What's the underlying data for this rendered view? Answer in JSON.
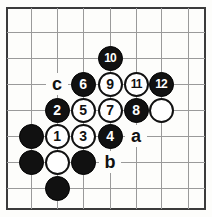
{
  "diagram": {
    "board": {
      "grid_color": "#9a9a9a",
      "border_color": "#3b3b3b",
      "background_color": "#fdfdfb",
      "columns": 8,
      "rows": 8,
      "line_xs": [
        31,
        57,
        83,
        110,
        136,
        161,
        188
      ],
      "line_ys": [
        32,
        58,
        84,
        110,
        136,
        162,
        188
      ]
    },
    "colors": {
      "black_stone": "#111111",
      "white_stone": "#ffffff",
      "black_text": "#ffffff",
      "white_text": "#111111",
      "label_text": "#111111"
    },
    "stones": [
      {
        "name": "stone-10",
        "color": "black",
        "label": "10",
        "x": 110,
        "y": 58
      },
      {
        "name": "stone-6",
        "color": "black",
        "label": "6",
        "x": 83,
        "y": 84
      },
      {
        "name": "stone-9",
        "color": "white",
        "label": "9",
        "x": 110,
        "y": 84
      },
      {
        "name": "stone-11",
        "color": "white",
        "label": "11",
        "x": 136,
        "y": 84
      },
      {
        "name": "stone-12",
        "color": "black",
        "label": "12",
        "x": 161,
        "y": 84
      },
      {
        "name": "stone-2",
        "color": "black",
        "label": "2",
        "x": 57,
        "y": 110
      },
      {
        "name": "stone-5",
        "color": "white",
        "label": "5",
        "x": 83,
        "y": 110
      },
      {
        "name": "stone-7",
        "color": "white",
        "label": "7",
        "x": 110,
        "y": 110
      },
      {
        "name": "stone-8",
        "color": "black",
        "label": "8",
        "x": 136,
        "y": 110
      },
      {
        "name": "stone-white-plain-right",
        "color": "white",
        "label": "",
        "x": 161,
        "y": 110
      },
      {
        "name": "stone-black-plain-left-upper",
        "color": "black",
        "label": "",
        "x": 31,
        "y": 136
      },
      {
        "name": "stone-1",
        "color": "white",
        "label": "1",
        "x": 57,
        "y": 136
      },
      {
        "name": "stone-3",
        "color": "white",
        "label": "3",
        "x": 83,
        "y": 136
      },
      {
        "name": "stone-4",
        "color": "black",
        "label": "4",
        "x": 110,
        "y": 136
      },
      {
        "name": "stone-black-plain-left-lower",
        "color": "black",
        "label": "",
        "x": 31,
        "y": 162
      },
      {
        "name": "stone-white-plain-lower",
        "color": "white",
        "label": "",
        "x": 57,
        "y": 162
      },
      {
        "name": "stone-black-plain-lower",
        "color": "black",
        "label": "",
        "x": 83,
        "y": 162
      },
      {
        "name": "stone-black-plain-bottom",
        "color": "black",
        "label": "",
        "x": 57,
        "y": 188
      }
    ],
    "point_labels": [
      {
        "name": "point-label-c",
        "label": "c",
        "x": 57,
        "y": 84
      },
      {
        "name": "point-label-a",
        "label": "a",
        "x": 136,
        "y": 136
      },
      {
        "name": "point-label-b",
        "label": "b",
        "x": 110,
        "y": 162
      }
    ]
  }
}
